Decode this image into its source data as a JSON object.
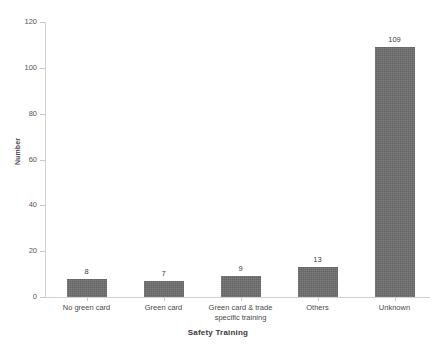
{
  "chart_data": {
    "type": "bar",
    "title": "",
    "subtitle": "",
    "xlabel": "Safety Training",
    "ylabel": "Number",
    "categories": [
      "No green card",
      "Green card",
      "Green card & trade specific training",
      "Others",
      "Unknown"
    ],
    "values": [
      8,
      7,
      9,
      13,
      109
    ],
    "data_labels": [
      "8",
      "7",
      "9",
      "13",
      "109"
    ],
    "ylim": [
      0,
      120
    ],
    "ytick_labels": [
      "0",
      "20",
      "40",
      "60",
      "80",
      "100",
      "120"
    ],
    "ytick_values": [
      0,
      20,
      40,
      60,
      80,
      100,
      120
    ],
    "grid": false,
    "legend": null,
    "bar_color": "#6e6e6e",
    "axis_color": "#d2d2d2",
    "text_color": "#4a4a4a",
    "background": "#ffffff"
  },
  "xtick_label_lines": [
    [
      "No green card"
    ],
    [
      "Green card"
    ],
    [
      "Green card & trade",
      "specific training"
    ],
    [
      "Others"
    ],
    [
      "Unknown"
    ]
  ]
}
